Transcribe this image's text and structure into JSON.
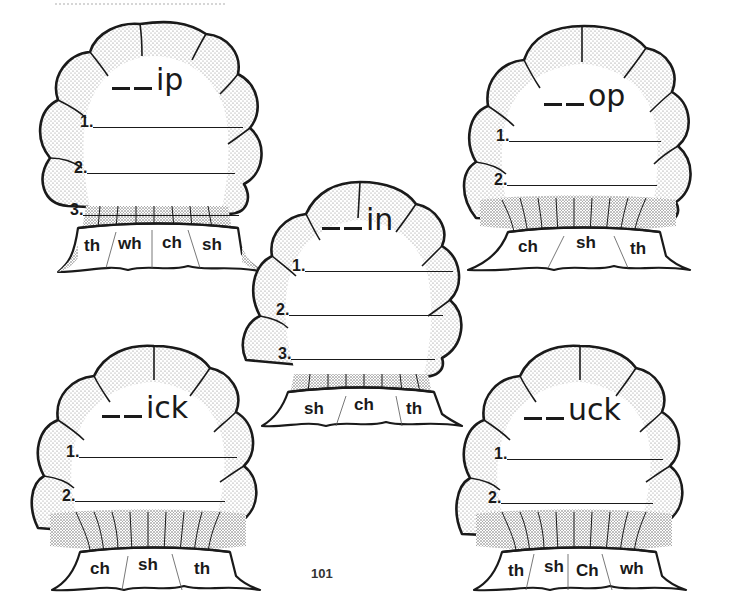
{
  "page": {
    "page_number": "101"
  },
  "shells": [
    {
      "id": "ip",
      "word_ending": "ip",
      "lines": [
        "1.",
        "2.",
        "3."
      ],
      "digraphs": [
        "th",
        "wh",
        "ch",
        "sh"
      ]
    },
    {
      "id": "op",
      "word_ending": "op",
      "lines": [
        "1.",
        "2."
      ],
      "digraphs": [
        "ch",
        "sh",
        "th"
      ]
    },
    {
      "id": "in",
      "word_ending": "in",
      "lines": [
        "1.",
        "2.",
        "3."
      ],
      "digraphs": [
        "sh",
        "ch",
        "th"
      ]
    },
    {
      "id": "ick",
      "word_ending": "ick",
      "lines": [
        "1.",
        "2."
      ],
      "digraphs": [
        "ch",
        "sh",
        "th"
      ]
    },
    {
      "id": "uck",
      "word_ending": "uck",
      "lines": [
        "1.",
        "2."
      ],
      "digraphs": [
        "th",
        "sh",
        "Ch",
        "wh"
      ]
    }
  ],
  "colors": {
    "ink": "#1a1a1a",
    "stipple": "#9a9a9a",
    "paper": "#ffffff"
  }
}
